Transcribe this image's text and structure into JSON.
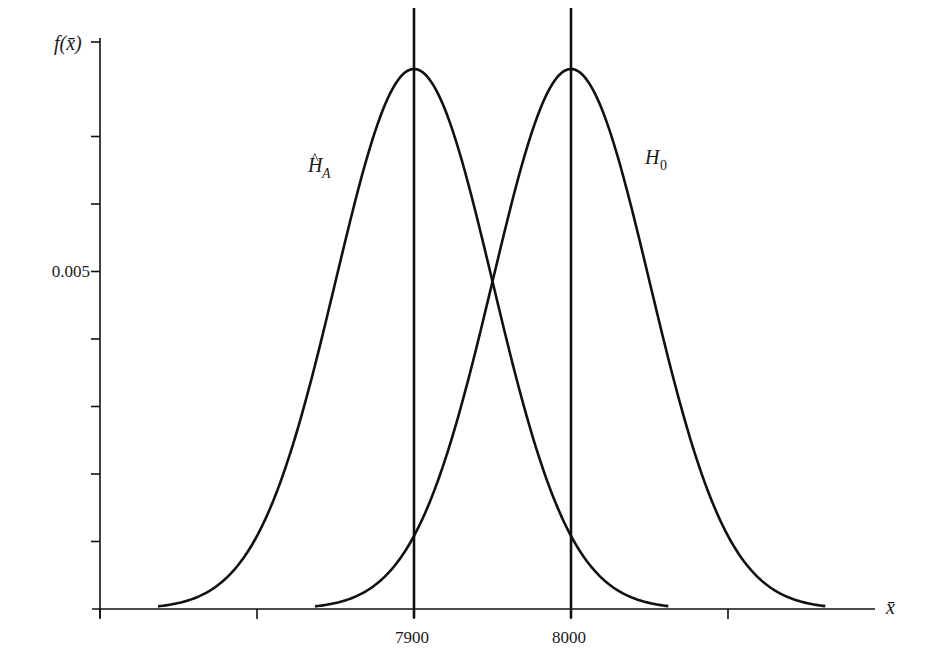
{
  "chart_data": {
    "type": "line",
    "title": "",
    "xlabel": "x̄",
    "ylabel": "f(x̄)",
    "xlim": [
      7700,
      8200
    ],
    "ylim": [
      0,
      0.0085
    ],
    "grid": false,
    "legend": "none (inline curve labels)",
    "x_ticks": [
      7700,
      7800,
      7900,
      8000,
      8100
    ],
    "x_tick_labels": [
      "",
      "",
      "7900",
      "8000",
      ""
    ],
    "y_ticks": [
      0.001,
      0.002,
      0.003,
      0.004,
      0.005,
      0.006,
      0.007,
      0.0084
    ],
    "y_tick_labels": [
      "",
      "",
      "",
      "",
      "0.005",
      "",
      "",
      ""
    ],
    "series": [
      {
        "name": "Ĥ_A",
        "distribution": "normal",
        "mean": 7900,
        "sd": 50,
        "peak": 0.008,
        "x_range": [
          7737,
          8062
        ]
      },
      {
        "name": "H_0",
        "distribution": "normal",
        "mean": 8000,
        "sd": 50,
        "peak": 0.008,
        "x_range": [
          7837,
          8162
        ]
      }
    ],
    "vertical_lines": [
      7900,
      8000
    ],
    "annotations": [
      {
        "text": "Ĥ_A",
        "near": "left curve, left side"
      },
      {
        "text": "H_0",
        "near": "right curve, right side"
      }
    ]
  },
  "labels": {
    "y_axis": "f(x̄)",
    "x_axis": "x̄",
    "y_tick_0005": "0.005",
    "x_tick_7900": "7900",
    "x_tick_8000": "8000",
    "curve_a_main": "H",
    "curve_a_hat": "^",
    "curve_a_sub": "A",
    "curve_0_main": "H",
    "curve_0_sub": "0"
  },
  "colors": {
    "line": "#111111",
    "background": "#ffffff"
  }
}
